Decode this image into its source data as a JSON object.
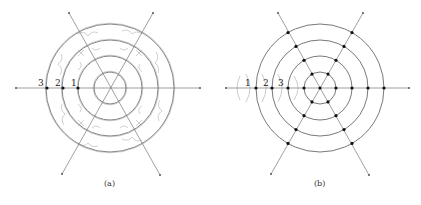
{
  "figure": {
    "panels": [
      {
        "id": "a",
        "caption": "(a)",
        "center": [
          110,
          88
        ],
        "radii": [
          16,
          32,
          48,
          64
        ],
        "ray_labels": [
          "3",
          "2",
          "1"
        ],
        "ray_label_positions": [
          [
            42,
            84
          ],
          [
            58,
            84
          ],
          [
            74,
            84
          ]
        ],
        "dots": [
          [
            47,
            88
          ],
          [
            63,
            88
          ],
          [
            78,
            88
          ]
        ]
      },
      {
        "id": "b",
        "caption": "(b)",
        "center": [
          320,
          88
        ],
        "radii": [
          16,
          32,
          48,
          64
        ],
        "ray_labels": [
          "1",
          "2",
          "3"
        ],
        "ray_label_positions": [
          [
            244,
            86
          ],
          [
            264,
            86
          ],
          [
            279,
            86
          ]
        ]
      }
    ],
    "colors": {
      "line": "#777777",
      "circle": "#666666",
      "wave": "#aaaaaa",
      "dot": "#111111"
    }
  }
}
